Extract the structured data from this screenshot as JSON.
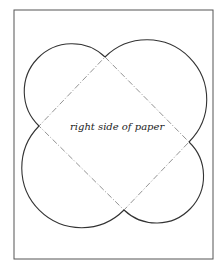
{
  "diagram": {
    "label": "right side of paper",
    "colors": {
      "frame": "#555555",
      "outline": "#333333",
      "fold_line": "#777777",
      "background": "#ffffff"
    },
    "frame": {
      "x": 14,
      "y": 10,
      "width": 199,
      "height": 249
    },
    "diamond": {
      "top": [
        105,
        57
      ],
      "left": [
        39,
        126
      ],
      "right": [
        189,
        142
      ],
      "bottom": [
        124,
        210
      ],
      "line_style": "dash-dot"
    },
    "petals": [
      "top-left",
      "top-right",
      "bottom-left",
      "bottom-right"
    ]
  }
}
